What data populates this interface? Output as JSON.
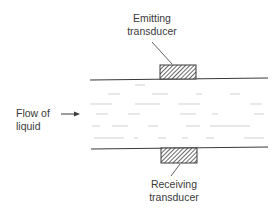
{
  "diagram": {
    "title": "",
    "labels": {
      "emitting_line1": "Emitting",
      "emitting_line2": "transducer",
      "receiving_line1": "Receiving",
      "receiving_line2": "transducer",
      "flow_line1": "Flow of",
      "flow_line2": "liquid"
    },
    "colors": {
      "line": "#3a3a3a",
      "text": "#3a3a3a",
      "hatch": "#444444",
      "background": "#ffffff"
    }
  }
}
